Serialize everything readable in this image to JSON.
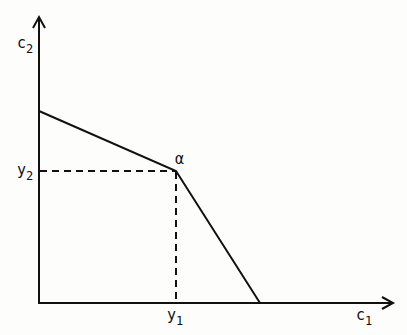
{
  "diagram": {
    "type": "piecewise-linear-frontier",
    "axes": {
      "x": {
        "label": "c",
        "subscript": "1"
      },
      "y": {
        "label": "c",
        "subscript": "2"
      }
    },
    "point": {
      "label": "α"
    },
    "ticks": {
      "x": {
        "label": "y",
        "subscript": "1"
      },
      "y": {
        "label": "y",
        "subscript": "2"
      }
    },
    "colors": {
      "line": "#111111",
      "background": "#fdfdfb"
    }
  }
}
